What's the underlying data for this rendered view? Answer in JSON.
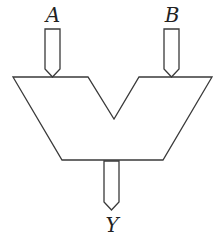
{
  "diagram": {
    "type": "ALU symbol",
    "inputs": [
      {
        "label": "A"
      },
      {
        "label": "B"
      }
    ],
    "output": {
      "label": "Y"
    },
    "colors": {
      "stroke": "#3a3a3a",
      "background": "#ffffff",
      "text": "#222222"
    }
  }
}
